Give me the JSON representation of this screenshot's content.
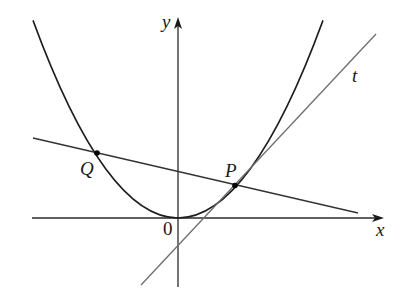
{
  "figure": {
    "labels": {
      "x_axis": "x",
      "y_axis": "y",
      "origin": "0",
      "point_p": "P",
      "point_q": "Q",
      "tangent": "t"
    },
    "colors": {
      "curve": "#1e1e1e",
      "axes": "#2a2a2a",
      "secant": "#333333",
      "tangent": "#6e6e6e",
      "points": "#000000"
    }
  }
}
